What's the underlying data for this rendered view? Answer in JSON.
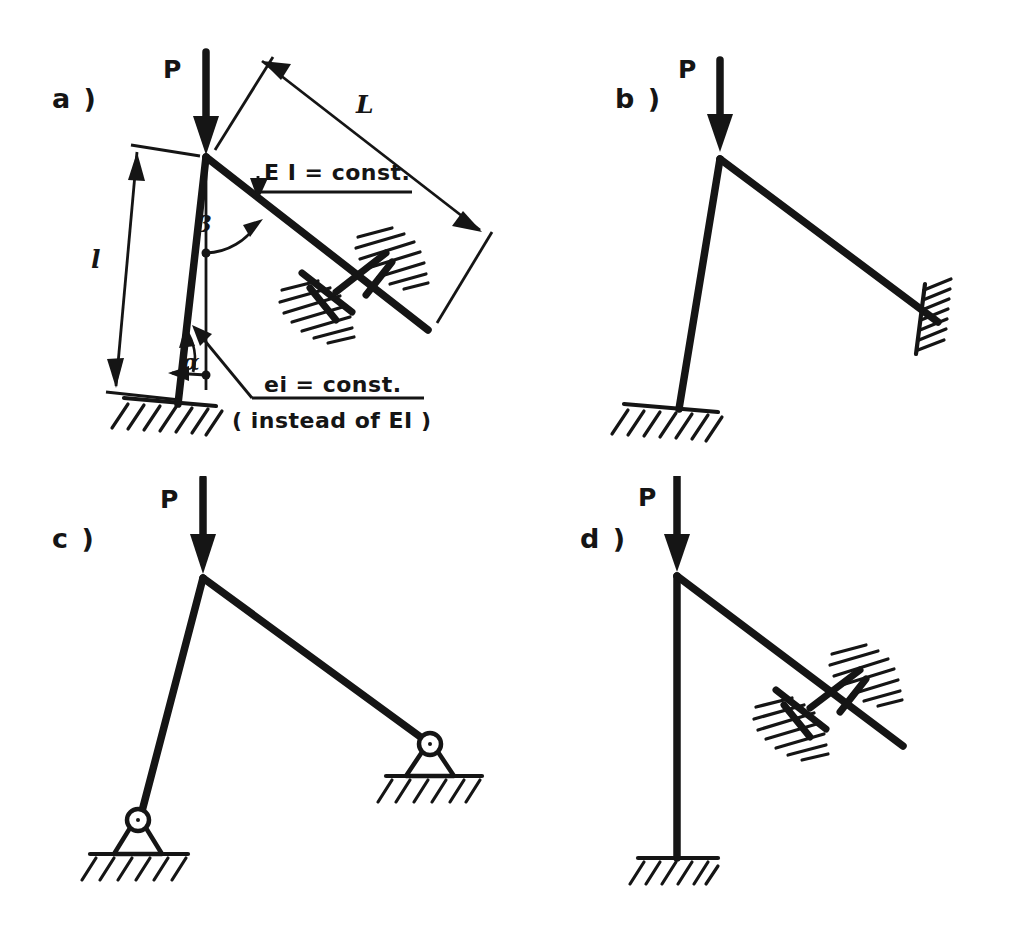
{
  "figure": {
    "background_color": "#ffffff",
    "ink_color": "#151515"
  },
  "panels": [
    {
      "id": "a",
      "label": "a )",
      "load_label": "P",
      "annotations": {
        "beam_stiffness": "E I = const.",
        "column_stiffness": "ei = const.",
        "column_stiffness_note": "( instead of EI )",
        "beam_length": "L",
        "column_length": "l",
        "beam_angle": "β",
        "column_angle": "α"
      },
      "supports": {
        "column_base": "fixed-support",
        "beam_end": "sliding-guided-support"
      }
    },
    {
      "id": "b",
      "label": "b )",
      "load_label": "P",
      "supports": {
        "column_base": "fixed-support",
        "beam_end": "inclined-fixed-support"
      }
    },
    {
      "id": "c",
      "label": "c )",
      "load_label": "P",
      "supports": {
        "column_base": "pinned-support",
        "beam_end": "pinned-support"
      }
    },
    {
      "id": "d",
      "label": "d )",
      "load_label": "P",
      "supports": {
        "column_base": "fixed-support",
        "beam_end": "sliding-guided-support"
      }
    }
  ]
}
